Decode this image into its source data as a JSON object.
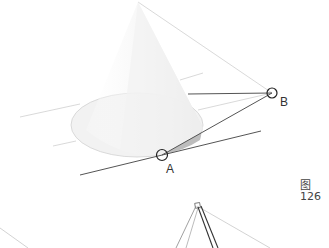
{
  "diagram": {
    "type": "cone-tangent-geometry",
    "points": [
      {
        "id": "A",
        "label": "A"
      },
      {
        "id": "B",
        "label": "B"
      }
    ],
    "caption": "图126",
    "colors": {
      "construction_line": "#c8c8c8",
      "main_line": "#555555",
      "cone_fill": "#f4f4f4",
      "cone_shade": "#bdbdbd",
      "marker": "#222222"
    }
  }
}
